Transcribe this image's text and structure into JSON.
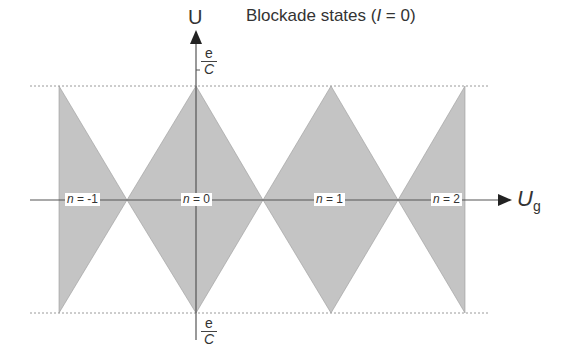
{
  "title": {
    "prefix": "Blockade states (",
    "var": "I",
    "suffix": " = 0)"
  },
  "axes": {
    "y_label": "U",
    "x_label_main": "U",
    "x_label_sub": "g",
    "top_tick": {
      "num": "e",
      "den": "C"
    },
    "bottom_tick": {
      "num": "e",
      "den": "C"
    }
  },
  "states": [
    {
      "var": "n",
      "text": " = -1"
    },
    {
      "var": "n",
      "text": " = 0"
    },
    {
      "var": "n",
      "text": " = 1"
    },
    {
      "var": "n",
      "text": " = 2"
    }
  ],
  "colors": {
    "fill": "#c4c4c4",
    "axis": "#555555",
    "dotted": "#9a9a9a"
  }
}
